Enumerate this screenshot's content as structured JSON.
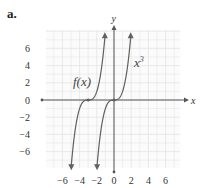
{
  "part_label": "a.",
  "chart_data": {
    "type": "line",
    "title": "",
    "xlabel": "x",
    "ylabel": "y",
    "xlim": [
      -8,
      8
    ],
    "ylim": [
      -8,
      8
    ],
    "grid": true,
    "x_ticks": [
      -6,
      -4,
      -2,
      0,
      2,
      4,
      6
    ],
    "y_ticks": [
      6,
      4,
      2,
      0,
      -2,
      -4,
      -6
    ],
    "x_tick_labels": [
      "−6",
      "−4",
      "−2",
      "0",
      "2",
      "4",
      "6"
    ],
    "y_tick_labels": [
      "6",
      "4",
      "2",
      "0",
      "−2",
      "−4",
      "−6"
    ],
    "series": [
      {
        "name": "x³",
        "label": "x",
        "superscript": "3",
        "expression": "x^3",
        "inflection": [
          0,
          0
        ],
        "color": "#555555"
      },
      {
        "name": "f(x)",
        "label": "f(x)",
        "expression": "(x+3)^3",
        "inflection": [
          -3,
          0
        ],
        "color": "#555555"
      }
    ],
    "annotations": [
      "f(x)",
      "x³"
    ]
  },
  "colors": {
    "grid": "#e6e6e6",
    "axis": "#555555",
    "curve": "#606060",
    "text": "#333333"
  }
}
